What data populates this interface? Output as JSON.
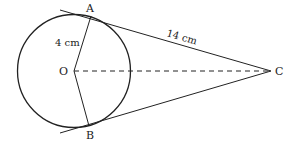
{
  "diagram": {
    "type": "geometry",
    "points": {
      "A": "A",
      "B": "B",
      "C": "C",
      "O": "O"
    },
    "labels": {
      "radius": "4 cm",
      "tangent": "14 cm"
    },
    "colors": {
      "stroke": "#222222",
      "background": "#ffffff"
    }
  }
}
